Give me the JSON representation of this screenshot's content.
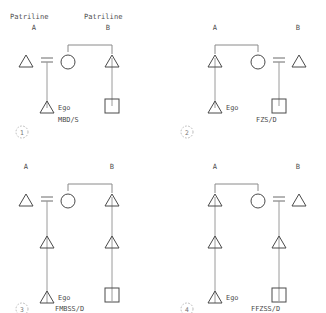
{
  "figure": {
    "background_color": "#ffffff",
    "symbol_stroke_color": "#4a4a4a",
    "link_stroke_color": "#8a8a8a"
  },
  "headers": {
    "left_line1": "Patriline",
    "left_line2": "A",
    "right_line1": "Patriline",
    "right_line2": "B"
  },
  "panels": [
    {
      "number": "1",
      "left_label": "Patriline",
      "left_label2": "A",
      "right_label": "Patriline",
      "right_label2": "B",
      "ego_label": "Ego",
      "code": "MBD/S",
      "generations": 2
    },
    {
      "number": "2",
      "left_label": "A",
      "right_label": "B",
      "ego_label": "Ego",
      "code": "FZS/D",
      "generations": 2
    },
    {
      "number": "3",
      "left_label": "A",
      "right_label": "B",
      "ego_label": "Ego",
      "code": "FMBSS/D",
      "generations": 3
    },
    {
      "number": "4",
      "left_label": "A",
      "right_label": "B",
      "ego_label": "Ego",
      "code": "FFZSS/D",
      "generations": 3
    }
  ],
  "legend": {
    "triangle": "male",
    "circle": "female",
    "square": "sibling-set",
    "equals": "marriage"
  }
}
